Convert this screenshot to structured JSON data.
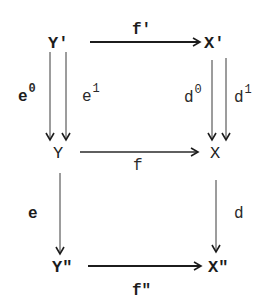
{
  "diagram": {
    "type": "commutative-diagram",
    "nodes": {
      "y_prime": "Y'",
      "x_prime": "X'",
      "y": "Y",
      "x": "X",
      "y_dprime": "Y\"",
      "x_dprime": "X\""
    },
    "edges": {
      "f_prime": {
        "label": "f'",
        "from": "Y'",
        "to": "X'"
      },
      "e0": {
        "label": "e",
        "sup": "0",
        "from": "Y'",
        "to": "Y"
      },
      "e1": {
        "label": "e",
        "sup": "1",
        "from": "Y'",
        "to": "Y"
      },
      "d0": {
        "label": "d",
        "sup": "0",
        "from": "X'",
        "to": "X"
      },
      "d1": {
        "label": "d",
        "sup": "1",
        "from": "X'",
        "to": "X"
      },
      "f": {
        "label": "f",
        "from": "Y",
        "to": "X"
      },
      "e": {
        "label": "e",
        "from": "Y",
        "to": "Y\""
      },
      "d": {
        "label": "d",
        "from": "X",
        "to": "X\""
      },
      "f_dprime": {
        "label": "f\"",
        "from": "Y\"",
        "to": "X\""
      }
    }
  }
}
